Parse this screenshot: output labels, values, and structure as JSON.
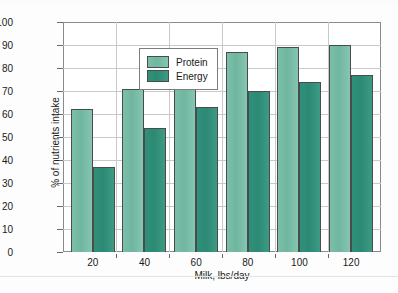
{
  "chart_data": {
    "type": "bar",
    "title": "",
    "subtitle": "",
    "xlabel": "Milk, lbs/day",
    "ylabel": "% of nutrients intake",
    "categories": [
      "20",
      "40",
      "60",
      "80",
      "100",
      "120"
    ],
    "series": [
      {
        "name": "Protein",
        "color": "#6fb6a0",
        "values": [
          62,
          71,
          84,
          87,
          89,
          90
        ]
      },
      {
        "name": "Energy",
        "color": "#2e9178",
        "values": [
          37,
          54,
          63,
          70,
          74,
          77
        ]
      }
    ],
    "ylim": [
      0,
      100
    ],
    "ytick_values": [
      0,
      10,
      20,
      30,
      40,
      50,
      60,
      70,
      80,
      90,
      100
    ],
    "ytick_labels": [
      "0",
      "10",
      "20",
      "30",
      "40",
      "50",
      "60",
      "70",
      "80",
      "90",
      "100"
    ],
    "grid": true,
    "grid_axis": "both",
    "legend_position": "upper-left",
    "legend_entries": [
      "Protein",
      "Energy"
    ]
  },
  "figure": {
    "caption_ghost": ""
  }
}
